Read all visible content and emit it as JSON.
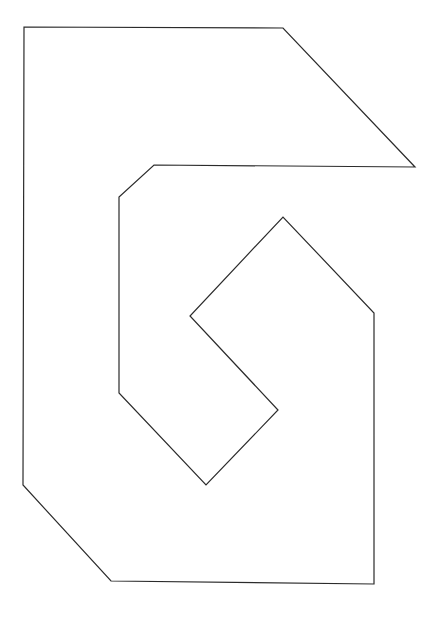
{
  "canvas": {
    "width": 440,
    "height": 617,
    "background_color": "#ffffff"
  },
  "figure": {
    "name": "spiral-notched-polygon",
    "stroke_color": "#2b2b2b",
    "fill_color": "none",
    "stroke_width": 1.2,
    "closed": true,
    "vertex_count": 14,
    "vertices": [
      [
        24,
        27
      ],
      [
        283,
        28
      ],
      [
        415,
        167
      ],
      [
        154,
        165
      ],
      [
        119,
        197
      ],
      [
        119,
        393
      ],
      [
        206,
        485
      ],
      [
        278,
        410
      ],
      [
        190,
        316
      ],
      [
        283,
        217
      ],
      [
        374,
        313
      ],
      [
        374,
        584
      ],
      [
        111,
        581
      ],
      [
        23,
        485
      ]
    ],
    "segments": [
      {
        "name": "top-edge",
        "from": [
          24,
          27
        ],
        "to": [
          283,
          28
        ],
        "kind": "horizontal"
      },
      {
        "name": "upper-right-bevel",
        "from": [
          283,
          28
        ],
        "to": [
          415,
          167
        ],
        "kind": "diagonal"
      },
      {
        "name": "inner-upper-horizontal",
        "from": [
          415,
          167
        ],
        "to": [
          154,
          165
        ],
        "kind": "horizontal"
      },
      {
        "name": "inner-upper-left-bevel",
        "from": [
          154,
          165
        ],
        "to": [
          119,
          197
        ],
        "kind": "diagonal"
      },
      {
        "name": "inner-left-vertical",
        "from": [
          119,
          197
        ],
        "to": [
          119,
          393
        ],
        "kind": "vertical"
      },
      {
        "name": "inner-lower-left-diagonal",
        "from": [
          119,
          393
        ],
        "to": [
          206,
          485
        ],
        "kind": "diagonal"
      },
      {
        "name": "diamond-lower-right-diagonal",
        "from": [
          206,
          485
        ],
        "to": [
          278,
          410
        ],
        "kind": "diagonal"
      },
      {
        "name": "diamond-inner-lower-left-diagonal",
        "from": [
          278,
          410
        ],
        "to": [
          190,
          316
        ],
        "kind": "diagonal"
      },
      {
        "name": "diamond-inner-upper-right-diagonal",
        "from": [
          190,
          316
        ],
        "to": [
          283,
          217
        ],
        "kind": "diagonal"
      },
      {
        "name": "diamond-upper-right-diagonal",
        "from": [
          283,
          217
        ],
        "to": [
          374,
          313
        ],
        "kind": "diagonal"
      },
      {
        "name": "outer-right-vertical",
        "from": [
          374,
          313
        ],
        "to": [
          374,
          584
        ],
        "kind": "vertical"
      },
      {
        "name": "bottom-edge",
        "from": [
          374,
          584
        ],
        "to": [
          111,
          581
        ],
        "kind": "horizontal"
      },
      {
        "name": "bottom-left-bevel",
        "from": [
          111,
          581
        ],
        "to": [
          23,
          485
        ],
        "kind": "diagonal"
      },
      {
        "name": "outer-left-vertical",
        "from": [
          23,
          485
        ],
        "to": [
          24,
          27
        ],
        "kind": "vertical"
      }
    ]
  }
}
